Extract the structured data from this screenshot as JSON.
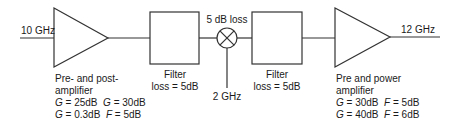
{
  "diagram": {
    "type": "block-diagram",
    "stroke_color": "#333333",
    "input": {
      "label": "10 GHz"
    },
    "output": {
      "label": "12 GHz"
    },
    "stage1": {
      "kind": "amplifier",
      "lines": [
        "Pre- and post-",
        "amplifier"
      ],
      "params": [
        [
          {
            "sym": "G",
            "val": " = 25dB"
          },
          {
            "sym": "G",
            "val": " = 30dB"
          }
        ],
        [
          {
            "sym": "G",
            "val": " = 0.3dB"
          },
          {
            "sym": "F",
            "val": " = 5dB"
          }
        ]
      ]
    },
    "filter1": {
      "kind": "filter",
      "title": "Filter",
      "loss": "loss = 5dB"
    },
    "mixer": {
      "kind": "mixer",
      "loss_label": "5 dB loss",
      "lo_label": "2 GHz"
    },
    "filter2": {
      "kind": "filter",
      "title": "Filter",
      "loss": "loss = 5dB"
    },
    "stage2": {
      "kind": "amplifier",
      "lines": [
        "Pre and power",
        "amplifier"
      ],
      "params": [
        [
          {
            "sym": "G",
            "val": " = 30dB"
          },
          {
            "sym": "F",
            "val": " = 5dB"
          }
        ],
        [
          {
            "sym": "G",
            "val": " = 40dB"
          },
          {
            "sym": "F",
            "val": " = 6dB"
          }
        ]
      ]
    }
  }
}
